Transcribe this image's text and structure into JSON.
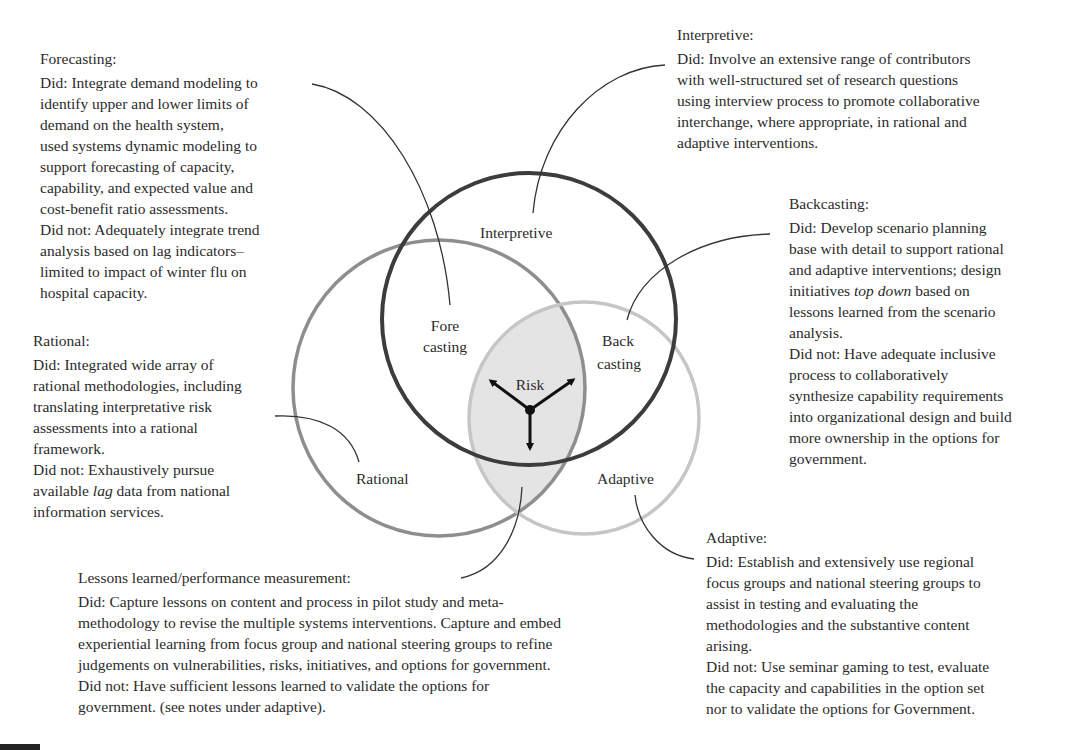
{
  "diagram": {
    "circles": [
      {
        "name": "Interpretive",
        "label": "Interpretive",
        "cx": 529,
        "cy": 319,
        "rx": 147,
        "ry": 146,
        "stroke": "#3a3a3a",
        "width": 4
      },
      {
        "name": "Rational",
        "label": "Rational",
        "cx": 439,
        "cy": 388,
        "rx": 146,
        "ry": 148,
        "stroke": "#8c8c8c",
        "width": 3.5
      },
      {
        "name": "Adaptive",
        "label": "Adaptive",
        "cx": 584,
        "cy": 418,
        "rx": 115,
        "ry": 116,
        "stroke": "#c4c4c4",
        "width": 3.5
      }
    ],
    "region_labels": {
      "interpretive": "Interpretive",
      "fore_1": "Fore",
      "fore_2": "casting",
      "back_1": "Back",
      "back_2": "casting",
      "risk": "Risk",
      "rational": "Rational",
      "adaptive": "Adaptive"
    },
    "shaded_region_color": "#e6e6e6"
  },
  "annotations": {
    "forecasting": {
      "title": "Forecasting:",
      "lines": [
        "Did: Integrate demand modeling to",
        "identify upper and lower limits of",
        "demand on the health system,",
        "used systems dynamic modeling to",
        "support forecasting of capacity,",
        "capability, and expected value and",
        "cost-benefit ratio assessments.",
        "Did not: Adequately integrate trend",
        "analysis based on lag indicators–",
        "limited to impact of winter flu on",
        "hospital capacity."
      ]
    },
    "interpretive": {
      "title": "Interpretive:",
      "lines": [
        "Did: Involve an extensive range of  contributors",
        "with well-structured set of research questions",
        "using interview process to promote collaborative",
        "interchange, where appropriate, in rational and",
        "adaptive interventions."
      ]
    },
    "backcasting": {
      "title": "Backcasting:",
      "lines": [
        "Did: Develop scenario planning",
        "base with detail to support rational",
        "and adaptive interventions; design",
        "initiatives ",
        "top down",
        " based on",
        "lessons learned from the scenario",
        "analysis.",
        "Did not: Have adequate inclusive",
        "process to collaboratively",
        "synthesize capability requirements",
        "into organizational design and build",
        "more ownership in the options for",
        "government."
      ]
    },
    "rational": {
      "title": "Rational:",
      "lines": [
        "Did: Integrated wide array of",
        "rational methodologies, including",
        "translating interpretative risk",
        "assessments into a rational",
        "framework.",
        "Did not: Exhaustively pursue",
        "available ",
        "lag",
        " data from national",
        "information services."
      ]
    },
    "lessons": {
      "title": "Lessons learned/performance measurement:",
      "lines": [
        "Did: Capture lessons on content and process in pilot study and meta-",
        "methodology to revise the multiple systems interventions.  Capture and embed",
        "experiential learning from focus group and national steering groups to refine",
        "judgements on vulnerabilities, risks, initiatives, and options for government.",
        "Did not: Have sufficient lessons learned to validate the options for",
        "government. (see notes under adaptive)."
      ]
    },
    "adaptive": {
      "title": "Adaptive:",
      "lines": [
        "Did: Establish and extensively use regional",
        "focus groups and national steering groups to",
        "assist in testing and evaluating the",
        "methodologies and the substantive content",
        "arising.",
        "Did not: Use seminar gaming to test, evaluate",
        "the capacity and capabilities in the option set",
        "nor to validate the options for Government."
      ]
    }
  }
}
